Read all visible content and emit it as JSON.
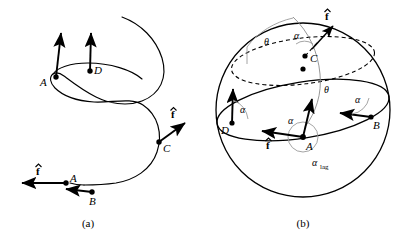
{
  "figure": {
    "panels": [
      {
        "id": "a",
        "caption": "(a)",
        "description": "helical trajectory with thrust direction vectors",
        "points": [
          {
            "name": "point-a-upper",
            "label": "A"
          },
          {
            "name": "point-d",
            "label": "D"
          },
          {
            "name": "point-c",
            "label": "C"
          },
          {
            "name": "point-a-lower",
            "label": "A"
          },
          {
            "name": "point-b",
            "label": "B"
          }
        ],
        "vector_labels": [
          {
            "name": "fhat-at-c",
            "label": "f"
          },
          {
            "name": "fhat-at-a-lower",
            "label": "f"
          }
        ]
      },
      {
        "id": "b",
        "caption": "(b)",
        "description": "sphere with equator, latitude circle and angle annotations",
        "points": [
          {
            "name": "point-c",
            "label": "C"
          },
          {
            "name": "point-d",
            "label": "D"
          },
          {
            "name": "point-a",
            "label": "A"
          },
          {
            "name": "point-b",
            "label": "B"
          }
        ],
        "angle_labels": [
          {
            "name": "angle-theta-top",
            "label": "θ"
          },
          {
            "name": "angle-theta-mid",
            "label": "θ"
          },
          {
            "name": "angle-alpha-at-c",
            "label": "α"
          },
          {
            "name": "angle-alpha-at-d",
            "label": "α"
          },
          {
            "name": "angle-alpha-at-a",
            "label": "α"
          },
          {
            "name": "angle-alpha-at-b",
            "label": "α"
          }
        ],
        "alpha_lag": {
          "symbol": "α",
          "subscript": "lag"
        },
        "vector_labels": [
          {
            "name": "fhat-at-c",
            "label": "f"
          },
          {
            "name": "fhat-at-a",
            "label": "f"
          }
        ]
      }
    ],
    "colors": {
      "stroke": "#000000",
      "gray_arc": "#8a8a8a",
      "angle_arc": "#9a9a9a",
      "background": "#ffffff"
    }
  }
}
